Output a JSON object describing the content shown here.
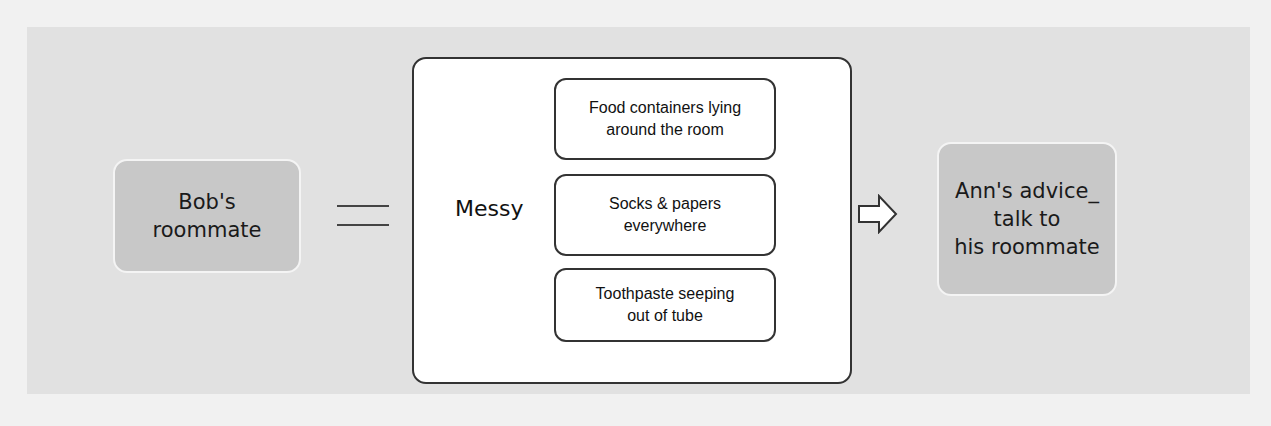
{
  "diagram": {
    "left_node": {
      "label_line1": "Bob's",
      "label_line2": "roommate"
    },
    "relation_symbol": "equals-icon",
    "center": {
      "label": "Messy",
      "items": [
        {
          "line1": "Food containers lying",
          "line2": "around the room"
        },
        {
          "line1": "Socks & papers",
          "line2": "everywhere"
        },
        {
          "line1": "Toothpaste seeping",
          "line2": "out of tube"
        }
      ]
    },
    "connector_symbol": "arrow-right-icon",
    "right_node": {
      "label_line1": "Ann's advice_",
      "label_line2": "talk to",
      "label_line3": "his roommate"
    }
  },
  "colors": {
    "panel": "#e1e1e1",
    "node": "#c8c8c8",
    "border": "#333333"
  }
}
